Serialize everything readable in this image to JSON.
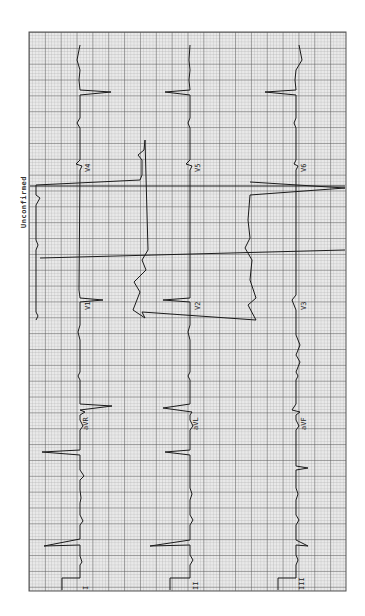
{
  "ecg": {
    "status_text": "Unconfirmed",
    "orientation": "rotated 90 degrees",
    "grid_color": "#8a8a8a",
    "trace_color": "#1a1a1a",
    "paper_color": "#e9e9e9",
    "rows": [
      {
        "leads": [
          "I",
          "aVR",
          "V1",
          "V4"
        ]
      },
      {
        "leads": [
          "II",
          "aVL",
          "V2",
          "V5"
        ]
      },
      {
        "leads": [
          "III",
          "aVF",
          "V3",
          "V6"
        ]
      }
    ],
    "labels": {
      "r1": {
        "c1": "I",
        "c2": "aVR",
        "c3": "V1",
        "c4": "V4"
      },
      "r2": {
        "c1": "II",
        "c2": "aVL",
        "c3": "V2",
        "c4": "V5"
      },
      "r3": {
        "c1": "III",
        "c2": "aVF",
        "c3": "V3",
        "c4": "V6"
      }
    }
  }
}
